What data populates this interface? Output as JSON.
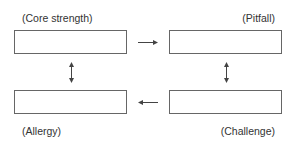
{
  "diagram": {
    "type": "core-quadrant",
    "nodes": [
      {
        "id": "core",
        "label": "(Core strength)",
        "position": "top-left"
      },
      {
        "id": "pitfall",
        "label": "(Pitfall)",
        "position": "top-right"
      },
      {
        "id": "challenge",
        "label": "(Challenge)",
        "position": "bottom-right"
      },
      {
        "id": "allergy",
        "label": "(Allergy)",
        "position": "bottom-left"
      }
    ],
    "edges": [
      {
        "from": "core",
        "to": "pitfall",
        "style": "single-arrow"
      },
      {
        "from": "pitfall",
        "to": "challenge",
        "style": "double-arrow"
      },
      {
        "from": "challenge",
        "to": "allergy",
        "style": "single-arrow"
      },
      {
        "from": "allergy",
        "to": "core",
        "style": "double-arrow"
      }
    ],
    "colors": {
      "stroke": "#666666",
      "text": "#333333"
    }
  }
}
